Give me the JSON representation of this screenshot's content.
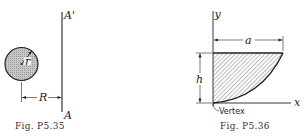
{
  "figures": [
    {
      "caption": "Fig. P5.35",
      "labels": {
        "axis_top": "A'",
        "axis_bottom": "A",
        "radius": "r",
        "distance": "R"
      }
    },
    {
      "caption": "Fig. P5.36",
      "labels": {
        "y_axis": "y",
        "x_axis": "x",
        "width": "a",
        "height": "h",
        "vertex": "Vertex"
      }
    }
  ],
  "colors": {
    "ink": "#222222",
    "shade": "#b5b5b5",
    "background": "#ffffff"
  }
}
